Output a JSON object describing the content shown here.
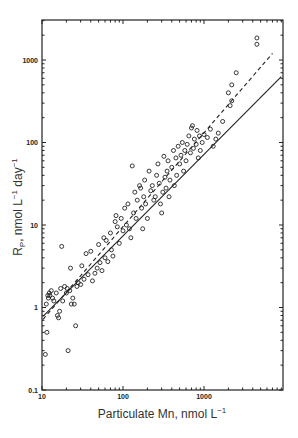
{
  "chart_data": {
    "type": "scatter",
    "title": "",
    "xlabel": "Particulate Mn, nmol L",
    "xlabel_sup": "−1",
    "ylabel": "R",
    "ylabel_sub": "P",
    "ylabel_rest": ", nmol L",
    "ylabel_sup1": "−1",
    "ylabel_mid": " day",
    "ylabel_sup2": "−1",
    "xscale": "log",
    "yscale": "log",
    "xlim": [
      10,
      9000
    ],
    "ylim": [
      0.1,
      3000
    ],
    "x_ticks": [
      "10",
      "100",
      "1000"
    ],
    "y_ticks": [
      "0.1",
      "1",
      "10",
      "100",
      "1000"
    ],
    "grid": false,
    "legend": null,
    "series": [
      {
        "name": "observations",
        "marker": "open-circle",
        "points": [
          [
            11,
            0.27
          ],
          [
            11.5,
            0.5
          ],
          [
            11.3,
            1.1
          ],
          [
            11.8,
            1.4
          ],
          [
            12,
            1.3
          ],
          [
            12.3,
            1.5
          ],
          [
            12.5,
            1.4
          ],
          [
            13,
            1.6
          ],
          [
            13.5,
            1.3
          ],
          [
            14,
            1.2
          ],
          [
            15,
            1.5
          ],
          [
            15.5,
            0.8
          ],
          [
            16,
            0.75
          ],
          [
            16.5,
            0.9
          ],
          [
            17,
            1.7
          ],
          [
            17.5,
            5.5
          ],
          [
            18,
            1.2
          ],
          [
            19,
            1.8
          ],
          [
            20,
            1.5
          ],
          [
            20.5,
            1.7
          ],
          [
            21,
            0.3
          ],
          [
            22,
            1.6
          ],
          [
            22.5,
            3.0
          ],
          [
            23,
            1.1
          ],
          [
            24,
            1.3
          ],
          [
            25,
            1.1
          ],
          [
            26,
            0.6
          ],
          [
            27,
            1.8
          ],
          [
            28,
            2.0
          ],
          [
            30,
            1.9
          ],
          [
            31,
            3.2
          ],
          [
            33,
            2.2
          ],
          [
            35,
            4.5
          ],
          [
            37,
            2.5
          ],
          [
            40,
            4.8
          ],
          [
            42,
            2.1
          ],
          [
            45,
            2.6
          ],
          [
            48,
            3.0
          ],
          [
            50,
            5.8
          ],
          [
            52,
            3.5
          ],
          [
            55,
            2.8
          ],
          [
            58,
            7.0
          ],
          [
            60,
            4.0
          ],
          [
            62,
            6.5
          ],
          [
            65,
            3.6
          ],
          [
            70,
            8.0
          ],
          [
            72,
            5.0
          ],
          [
            75,
            4.2
          ],
          [
            80,
            11
          ],
          [
            82,
            13
          ],
          [
            85,
            9.5
          ],
          [
            90,
            6.0
          ],
          [
            95,
            12
          ],
          [
            100,
            8.5
          ],
          [
            105,
            16
          ],
          [
            110,
            10
          ],
          [
            115,
            18
          ],
          [
            120,
            9
          ],
          [
            125,
            7
          ],
          [
            130,
            52
          ],
          [
            135,
            14
          ],
          [
            140,
            25
          ],
          [
            145,
            12
          ],
          [
            150,
            20
          ],
          [
            160,
            30
          ],
          [
            165,
            28
          ],
          [
            170,
            16
          ],
          [
            175,
            9
          ],
          [
            180,
            22
          ],
          [
            185,
            35
          ],
          [
            190,
            18
          ],
          [
            200,
            12
          ],
          [
            210,
            45
          ],
          [
            220,
            26
          ],
          [
            230,
            30
          ],
          [
            240,
            20
          ],
          [
            250,
            22
          ],
          [
            260,
            40
          ],
          [
            270,
            55
          ],
          [
            280,
            32
          ],
          [
            290,
            18
          ],
          [
            300,
            14
          ],
          [
            310,
            25
          ],
          [
            320,
            68
          ],
          [
            330,
            38
          ],
          [
            340,
            28
          ],
          [
            350,
            45
          ],
          [
            360,
            60
          ],
          [
            370,
            22
          ],
          [
            380,
            35
          ],
          [
            400,
            50
          ],
          [
            420,
            80
          ],
          [
            430,
            30
          ],
          [
            450,
            65
          ],
          [
            460,
            40
          ],
          [
            480,
            90
          ],
          [
            500,
            55
          ],
          [
            520,
            70
          ],
          [
            540,
            100
          ],
          [
            560,
            45
          ],
          [
            580,
            80
          ],
          [
            600,
            60
          ],
          [
            620,
            95
          ],
          [
            650,
            120
          ],
          [
            680,
            75
          ],
          [
            700,
            150
          ],
          [
            720,
            160
          ],
          [
            740,
            85
          ],
          [
            760,
            110
          ],
          [
            800,
            95
          ],
          [
            820,
            140
          ],
          [
            850,
            65
          ],
          [
            880,
            120
          ],
          [
            900,
            80
          ],
          [
            950,
            100
          ],
          [
            1000,
            125
          ],
          [
            1100,
            115
          ],
          [
            1200,
            145
          ],
          [
            1300,
            90
          ],
          [
            1400,
            110
          ],
          [
            1500,
            130
          ],
          [
            1700,
            180
          ],
          [
            2000,
            400
          ],
          [
            2200,
            500
          ],
          [
            2500,
            700
          ],
          [
            2200,
            320
          ],
          [
            4500,
            1550
          ],
          [
            4500,
            1850
          ],
          [
            2100,
            280
          ]
        ]
      }
    ],
    "lines": [
      {
        "name": "solid-regression",
        "style": "solid",
        "from": [
          10.3,
          0.78
        ],
        "to": [
          9000,
          630
        ]
      },
      {
        "name": "dashed-regression",
        "style": "dashed",
        "from": [
          10.3,
          0.72
        ],
        "to": [
          7000,
          1200
        ]
      }
    ]
  }
}
